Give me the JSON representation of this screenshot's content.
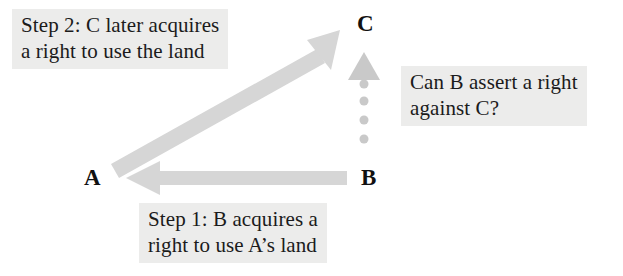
{
  "canvas": {
    "width": 623,
    "height": 276,
    "background": "#ffffff"
  },
  "palette": {
    "arrow_grey": "#d6d6d6",
    "dotted_arrow_grey": "#c9c9c9",
    "text_highlight": "#ececeb",
    "text_color": "#1b1b1b"
  },
  "vertices": [
    {
      "id": "a",
      "label": "A"
    },
    {
      "id": "b",
      "label": "B"
    },
    {
      "id": "c",
      "label": "C"
    }
  ],
  "annotations": {
    "step2": {
      "line1": "Step 2: C later acquires",
      "line2": "a right to use the land"
    },
    "question": {
      "line1": "Can B assert a right",
      "line2": "against C?"
    },
    "step1": {
      "line1": "Step 1: B acquires a",
      "line2": "right to use A’s land"
    }
  },
  "arrows": [
    {
      "id": "a-to-c",
      "from": "A",
      "to": "C",
      "style": "solid",
      "direction": "up-right"
    },
    {
      "id": "b-to-a",
      "from": "B",
      "to": "A",
      "style": "solid",
      "direction": "left"
    },
    {
      "id": "b-to-c",
      "from": "B",
      "to": "C",
      "style": "dotted",
      "direction": "up",
      "dot_count": 4
    }
  ]
}
